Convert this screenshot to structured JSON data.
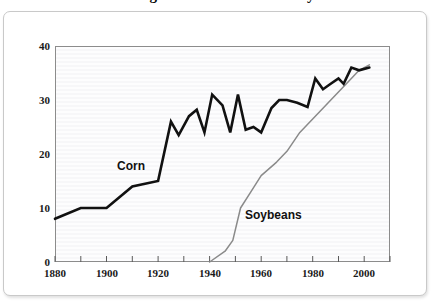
{
  "figure": {
    "title_clipped": "U.S. Average Yields of Corn and Soybeans",
    "frame_border_color": "#c9c9c9",
    "plot_border_color": "#8c8c8c",
    "plot_background": "#fcfcfd"
  },
  "chart_data": {
    "type": "line",
    "title": "U.S. Average Yields of Corn and Soybeans",
    "xlabel": "",
    "ylabel": "",
    "xlim": [
      1880,
      2010
    ],
    "ylim": [
      0,
      40
    ],
    "grid": false,
    "legend_position": "in-plot labels",
    "x_ticks_major": [
      1880,
      1900,
      1920,
      1940,
      1960,
      1980,
      2000
    ],
    "x_ticks_major_labels": [
      "1880",
      "1900",
      "1920",
      "1940",
      "1960",
      "1980",
      "2000"
    ],
    "x_ticks_minor": [
      1890,
      1910,
      1930,
      1950,
      1970,
      1990,
      2010
    ],
    "y_ticks": [
      0,
      10,
      20,
      30,
      40
    ],
    "y_tick_labels": [
      "0",
      "10",
      "20",
      "30",
      "40"
    ],
    "series": [
      {
        "name": "Corn",
        "label": "Corn",
        "color": "#111111",
        "line_width": 2.6,
        "x": [
          1880,
          1890,
          1900,
          1910,
          1920,
          1925,
          1928,
          1932,
          1935,
          1938,
          1941,
          1945,
          1948,
          1951,
          1954,
          1957,
          1960,
          1964,
          1967,
          1970,
          1974,
          1978,
          1981,
          1984,
          1987,
          1990,
          1992,
          1995,
          1998,
          2002
        ],
        "values": [
          8,
          10,
          10,
          14,
          15,
          26,
          23.5,
          27,
          28.2,
          24,
          31,
          29,
          24,
          31,
          24.5,
          25,
          24,
          28.5,
          30,
          30,
          29.5,
          28.7,
          34,
          32,
          33,
          34,
          33,
          36,
          35.5,
          36
        ]
      },
      {
        "name": "Soybeans",
        "label": "Soybeans",
        "color": "#8a8a8a",
        "line_width": 1.5,
        "x": [
          1940,
          1946,
          1949,
          1952,
          1956,
          1960,
          1966,
          1970,
          1975,
          1980,
          1985,
          1990,
          1995,
          1998,
          2002
        ],
        "values": [
          0,
          2.0,
          4.0,
          10.0,
          13.0,
          16.0,
          18.5,
          20.5,
          24.0,
          26.5,
          29.0,
          31.5,
          34.0,
          35.5,
          36.5
        ]
      }
    ],
    "annotations": [
      {
        "text": "Corn",
        "x": 1905,
        "y": 19.5
      },
      {
        "text": "Soybeans",
        "x": 1953,
        "y": 9.5
      }
    ]
  },
  "y_axis": {
    "labels": [
      "40",
      "30",
      "20",
      "10",
      "0"
    ]
  },
  "x_axis": {
    "labels": [
      "1880",
      "1900",
      "1920",
      "1940",
      "1960",
      "1980",
      "2000"
    ]
  },
  "series_labels": {
    "corn": "Corn",
    "soybeans": "Soybeans"
  }
}
